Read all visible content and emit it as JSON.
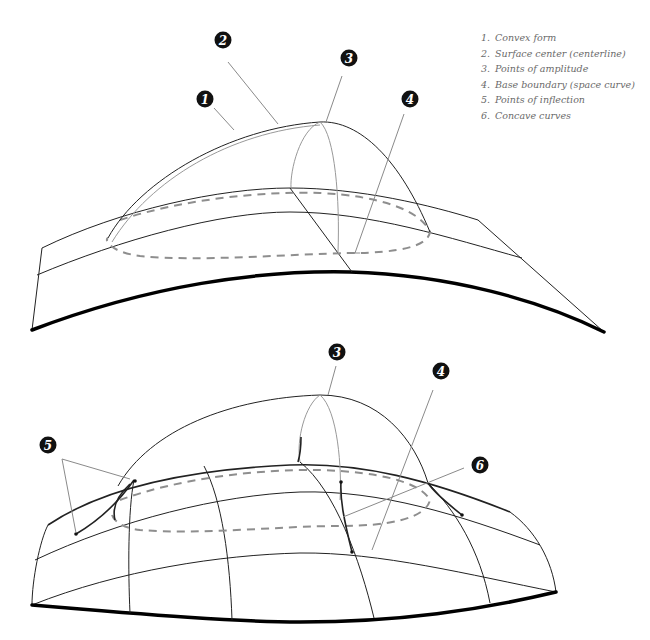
{
  "legend": {
    "items": [
      {
        "num": "1.",
        "label": "Convex form"
      },
      {
        "num": "2.",
        "label": "Surface center (centerline)"
      },
      {
        "num": "3.",
        "label": "Points of amplitude"
      },
      {
        "num": "4.",
        "label": "Base boundary (space curve)"
      },
      {
        "num": "5.",
        "label": "Points of inflection"
      },
      {
        "num": "6.",
        "label": "Concave curves"
      }
    ]
  },
  "top_diagram": {
    "markers": [
      "1",
      "2",
      "3",
      "4"
    ]
  },
  "bottom_diagram": {
    "markers": [
      "3",
      "4",
      "5",
      "6"
    ]
  },
  "colors": {
    "line": "#222222",
    "guide": "#999999",
    "dashed": "#8e8e8e",
    "marker_fill": "#111111"
  }
}
